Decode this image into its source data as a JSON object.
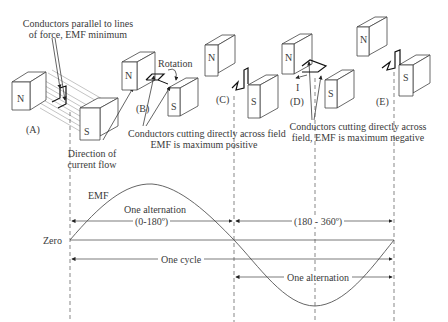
{
  "diagram": {
    "stages": [
      {
        "id": "A",
        "label": "(A)"
      },
      {
        "id": "B",
        "label": "(B)"
      },
      {
        "id": "C",
        "label": "(C)"
      },
      {
        "id": "D",
        "label": "(D)"
      },
      {
        "id": "E",
        "label": "(E)"
      }
    ],
    "magnet_labels": {
      "north": "N",
      "south": "S"
    },
    "annotations": {
      "parallel_line1": "Conductors parallel to lines",
      "parallel_line2": "of force, EMF minimum",
      "current_line1": "Direction of",
      "current_line2": "current flow",
      "rotation": "Rotation",
      "positive_line1": "Conductors cutting directly across field",
      "positive_line2": "EMF is maximum positive",
      "negative_line1": "Conductors cutting directly across",
      "negative_line2": "field, EMF is maximum negative",
      "current_symbol": "I"
    },
    "waveform": {
      "emf_label": "EMF",
      "zero_label": "Zero",
      "first_alternation_label": "One alternation",
      "first_range": "(0-180º)",
      "second_range": "(180 - 360º)",
      "cycle_label": "One cycle",
      "second_alternation_label": "One alternation"
    }
  }
}
